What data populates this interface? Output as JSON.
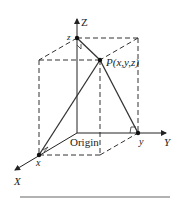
{
  "diagram": {
    "axes": {
      "x_label": "X",
      "y_label": "Y",
      "z_label": "Z"
    },
    "points": {
      "origin_label": "Origin",
      "x_label": "x",
      "y_label": "y",
      "z_label": "z",
      "p_label": "P(x,y,z)"
    },
    "colors": {
      "line": "#333333",
      "rule": "#999999",
      "background": "#ffffff"
    }
  }
}
